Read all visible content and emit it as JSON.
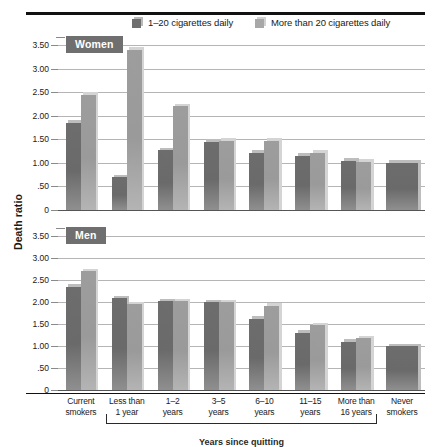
{
  "chart_data": {
    "type": "bar",
    "title": "",
    "xlabel": "Years since quitting",
    "ylabel": "Death ratio",
    "ylim": [
      0,
      3.5
    ],
    "grid": true,
    "legend_position": "top",
    "categories": [
      "Current smokers",
      "Less than 1 year",
      "1–2 years",
      "3–5 years",
      "6–10 years",
      "11–15 years",
      "More than 16 years",
      "Never smokers"
    ],
    "yticks": [
      "3.50",
      "3.00",
      "2.50",
      "2.00",
      "1.50",
      "1.00",
      ".50",
      "0"
    ],
    "ytick_values": [
      3.5,
      3.0,
      2.5,
      2.0,
      1.5,
      1.0,
      0.5,
      0
    ],
    "panels": [
      {
        "name": "Women",
        "series": [
          {
            "name": "1–20 cigarettes daily",
            "color": "#6d6d6d",
            "values": [
              1.85,
              0.7,
              1.27,
              1.45,
              1.22,
              1.15,
              1.05,
              null
            ]
          },
          {
            "name": "More than 20 cigarettes daily",
            "color": "#9d9d9d",
            "values": [
              2.45,
              3.4,
              2.2,
              1.47,
              1.47,
              1.22,
              1.02,
              null
            ]
          }
        ],
        "reference": {
          "name": "Never smokers",
          "value": 1.0
        }
      },
      {
        "name": "Men",
        "series": [
          {
            "name": "1–20 cigarettes daily",
            "color": "#6d6d6d",
            "values": [
              2.35,
              2.08,
              2.02,
              2.0,
              1.62,
              1.3,
              1.1,
              null
            ]
          },
          {
            "name": "More than 20 cigarettes daily",
            "color": "#9d9d9d",
            "values": [
              2.7,
              1.95,
              2.02,
              2.0,
              1.92,
              1.47,
              1.18,
              null
            ]
          }
        ],
        "reference": {
          "name": "Never smokers",
          "value": 1.0
        }
      }
    ]
  },
  "legend": {
    "items": [
      {
        "label": "1–20 cigarettes daily",
        "swatch": "dark-gray-swatch"
      },
      {
        "label": "More than 20 cigarettes daily",
        "swatch": "light-gray-swatch"
      }
    ]
  },
  "axis": {
    "y_title": "Death ratio"
  },
  "caption": "Years since quitting"
}
